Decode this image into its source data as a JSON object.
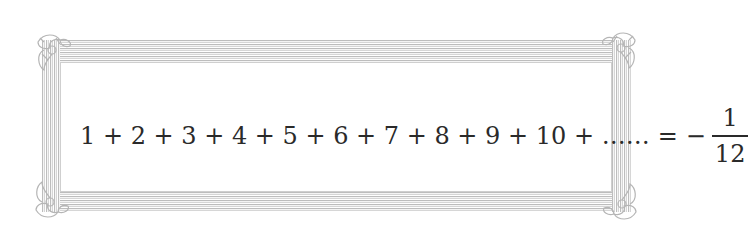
{
  "frame": {
    "style": "ornate-decorative-border",
    "corner_ornaments": [
      "top-left",
      "top-right",
      "bottom-left",
      "bottom-right"
    ],
    "border_color": "#bdbdbd",
    "background_color": "#ffffff"
  },
  "equation": {
    "terms": [
      "1",
      "2",
      "3",
      "4",
      "5",
      "6",
      "7",
      "8",
      "9",
      "10"
    ],
    "operator": "+",
    "ellipsis": "……",
    "equals": "=",
    "sign": "−",
    "result_numerator": "1",
    "result_denominator": "12",
    "lhs_text": "1 + 2 + 3 + 4 + 5 + 6 + 7 + 8 + 9 + 10 + ……",
    "text_color": "#2a2a2a"
  }
}
